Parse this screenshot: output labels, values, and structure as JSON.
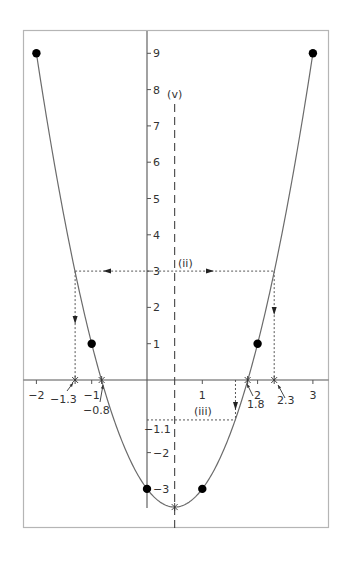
{
  "chart_data": {
    "type": "line",
    "title": "",
    "function": "y = 2x^2 - 2x - 3",
    "xlabel": "",
    "ylabel": "",
    "xlim": [
      -2.2,
      3.3
    ],
    "ylim": [
      -3.9,
      10.1
    ],
    "x_ticks": [
      -2,
      -1,
      1,
      2,
      3
    ],
    "x_tick_labels": [
      "−2",
      "−1",
      "1",
      "2",
      "3"
    ],
    "y_ticks": [
      9,
      8,
      7,
      6,
      5,
      4,
      3,
      2,
      1,
      -2,
      -3
    ],
    "y_tick_labels": [
      "9",
      "8",
      "7",
      "6",
      "5",
      "4",
      "3",
      "2",
      "1",
      "−2",
      "−3"
    ],
    "grid": false,
    "points": [
      {
        "x": -2,
        "y": 9
      },
      {
        "x": -1,
        "y": 1
      },
      {
        "x": 0,
        "y": -3
      },
      {
        "x": 1,
        "y": -3
      },
      {
        "x": 2,
        "y": 1
      },
      {
        "x": 3,
        "y": 9
      }
    ],
    "vertex": {
      "x": 0.5,
      "y": -3.5
    },
    "roots": [
      {
        "x": -0.82,
        "label": "−0.8"
      },
      {
        "x": 1.82,
        "label": "1.8"
      }
    ],
    "line_of_symmetry": {
      "x": 0.5,
      "label": "(v)"
    },
    "annotations": [
      {
        "id": "ii",
        "label": "(ii)",
        "y": 3,
        "x_left": -1.3,
        "x_right": 2.3,
        "x_left_label": "−1.3",
        "x_right_label": "2.3",
        "y_label": "3"
      },
      {
        "id": "iii",
        "label": "(iii)",
        "y": -1.1,
        "x": 1.6,
        "y_label": "−1.1"
      }
    ]
  }
}
